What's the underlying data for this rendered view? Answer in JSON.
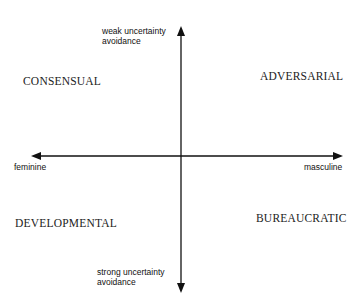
{
  "diagram": {
    "type": "quadrant-matrix",
    "axes": {
      "vertical": {
        "top_label": "weak uncertainty\navoidance",
        "bottom_label": "strong uncertainty\navoidance"
      },
      "horizontal": {
        "left_label": "feminine",
        "right_label": "masculine"
      }
    },
    "quadrants": {
      "top_left": "CONSENSUAL",
      "top_right": "ADVERSARIAL",
      "bottom_left": "DEVELOPMENTAL",
      "bottom_right": "BUREAUCRATIC"
    },
    "colors": {
      "axis": "#111111",
      "text": "#222222",
      "background": "#ffffff"
    }
  }
}
